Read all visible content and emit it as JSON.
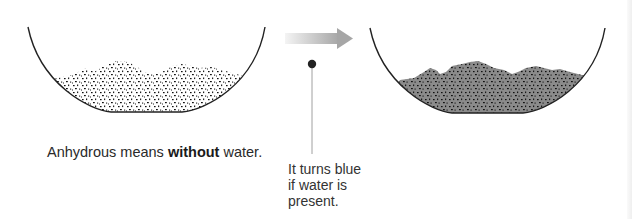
{
  "diagram": {
    "left_bowl": {
      "label": "anhydrous-solid",
      "fill": "#ffffff",
      "speckle": "#111111"
    },
    "right_bowl": {
      "label": "hydrated-solid",
      "fill": "#8a8a8a",
      "speckle": "#111111"
    },
    "arrow": {
      "direction": "right",
      "color_start": "#f2f2f2",
      "color_end": "#a8a8a8"
    },
    "pointer": {
      "dot_color": "#222222",
      "line_color": "#999999"
    }
  },
  "caption": {
    "before": "Anhydrous means ",
    "bold": "without",
    "after": " water."
  },
  "note": {
    "lines": [
      "It turns blue",
      "if water is",
      "present."
    ]
  }
}
